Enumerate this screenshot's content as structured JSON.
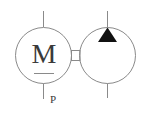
{
  "diagram": {
    "type": "hydraulic-symbol",
    "motor": {
      "label": "M",
      "port_label": "P"
    },
    "pump": {
      "direction_indicator": "filled-triangle-up"
    },
    "colors": {
      "line": "#8a8a8a",
      "text": "#3a3a3a",
      "fill": "#111111",
      "background": "#ffffff"
    }
  }
}
